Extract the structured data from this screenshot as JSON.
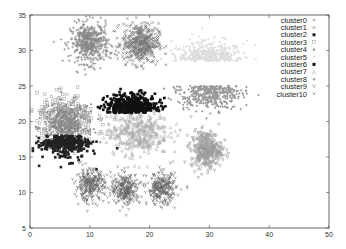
{
  "chart_data": {
    "type": "scatter",
    "title": "",
    "xlabel": "",
    "ylabel": "",
    "xlim": [
      0,
      50
    ],
    "ylim": [
      5,
      35
    ],
    "xticks": [
      0,
      10,
      20,
      30,
      40,
      50
    ],
    "yticks": [
      5,
      10,
      15,
      20,
      25,
      30,
      35
    ],
    "grid": false,
    "legend_position": "top-right",
    "series": [
      {
        "name": "cluster0",
        "marker": "+",
        "color": "#888888",
        "center": [
          10,
          31
        ],
        "spread": [
          1.6,
          1.4
        ],
        "count": 500
      },
      {
        "name": "cluster1",
        "marker": "x",
        "color": "#777777",
        "center": [
          18.5,
          31
        ],
        "spread": [
          1.5,
          1.4
        ],
        "count": 450
      },
      {
        "name": "cluster2",
        "marker": "filled-square",
        "color": "#222222",
        "center": [
          6,
          17.5
        ],
        "spread": [
          2.0,
          1.4
        ],
        "count": 350
      },
      {
        "name": "cluster3",
        "marker": "open-square",
        "color": "#999999",
        "center": [
          6,
          20.5
        ],
        "spread": [
          2.4,
          1.6
        ],
        "count": 300
      },
      {
        "name": "cluster4",
        "marker": "circle",
        "color": "#8a8a8a",
        "center": [
          6,
          19.5
        ],
        "spread": [
          1.8,
          1.4
        ],
        "count": 350
      },
      {
        "name": "cluster5",
        "marker": "dot",
        "color": "#dddddd",
        "center": [
          30,
          28.5
        ],
        "spread": [
          2.8,
          1.4
        ],
        "count": 450
      },
      {
        "name": "cluster6",
        "marker": "filled-square",
        "color": "#111111",
        "center": [
          17,
          21.5
        ],
        "spread": [
          2.2,
          1.3
        ],
        "count": 450
      },
      {
        "name": "cluster7",
        "marker": "triangle",
        "color": "#aaaaaa",
        "center": [
          18,
          18.5
        ],
        "spread": [
          2.6,
          1.6
        ],
        "count": 400
      },
      {
        "name": "cluster8",
        "marker": "diamond",
        "color": "#999999",
        "center": [
          30,
          25
        ],
        "spread": [
          2.6,
          1.6
        ],
        "count": 400
      },
      {
        "name": "cluster9",
        "marker": "inverted-triangle",
        "color": "#999999",
        "center": [
          29.5,
          16
        ],
        "spread": [
          1.3,
          1.3
        ],
        "count": 350
      },
      {
        "name": "cluster10",
        "marker": "y-shape",
        "color": "#666666",
        "center": [
          16,
          10.5
        ],
        "spread": [
          1.2,
          1.1
        ],
        "count": 900,
        "subcenters": [
          [
            10,
            11
          ],
          [
            16,
            10.5
          ],
          [
            22,
            10.5
          ]
        ]
      }
    ]
  }
}
